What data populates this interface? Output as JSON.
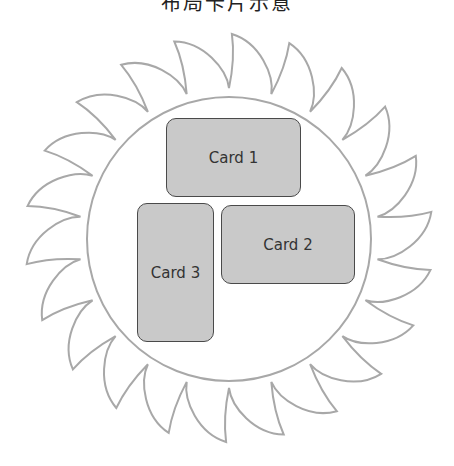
{
  "title": "布局卡片示意",
  "colors": {
    "blade_stroke": "#a8a8a8",
    "inner_circle_stroke": "#a8a8a8",
    "card_fill": "#c9c9c9",
    "card_border": "#4a4a4a",
    "card_text": "#333333"
  },
  "blade": {
    "cx": 229,
    "cy": 238,
    "tip_radius": 204,
    "valley_radius": 150,
    "teeth": 22,
    "inner_circle_radius": 142
  },
  "cards": [
    {
      "id": "card1",
      "label": "Card 1",
      "x": 166,
      "y": 118,
      "w": 135,
      "h": 79
    },
    {
      "id": "card2",
      "label": "Card 2",
      "x": 221,
      "y": 205,
      "w": 134,
      "h": 79
    },
    {
      "id": "card3",
      "label": "Card 3",
      "x": 137,
      "y": 203,
      "w": 77,
      "h": 139
    }
  ]
}
